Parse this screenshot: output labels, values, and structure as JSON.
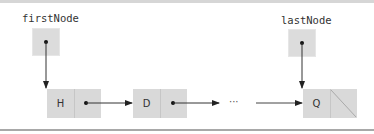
{
  "diagram": {
    "type": "singly-linked-list",
    "pointers": [
      {
        "label": "firstNode",
        "points_to": "H"
      },
      {
        "label": "lastNode",
        "points_to": "Q"
      }
    ],
    "nodes": [
      {
        "data": "H",
        "next": "D"
      },
      {
        "data": "D",
        "next": "..."
      },
      {
        "data": "Q",
        "next": "null"
      }
    ],
    "ellipsis": "···",
    "colors": {
      "box_fill": "#d9d9d9",
      "arrow": "#222222",
      "border": "#a8a8a8"
    }
  }
}
